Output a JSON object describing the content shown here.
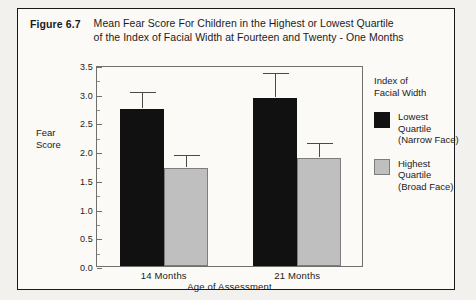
{
  "figure": {
    "label": "Figure 6.7",
    "caption_line1": "Mean Fear Score For Children in the Highest or Lowest Quartile",
    "caption_line2": "of the Index of Facial Width at Fourteen and Twenty - One Months"
  },
  "axis": {
    "y_title_line1": "Fear",
    "y_title_line2": "Score",
    "x_title": "Age of Assessment"
  },
  "legend": {
    "title_line1": "Index of",
    "title_line2": "Facial Width",
    "items": [
      {
        "swatch": "black",
        "line1": "Lowest",
        "line2": "Quartile",
        "line3": "(Narrow Face)"
      },
      {
        "swatch": "gray",
        "line1": "Highest",
        "line2": "Quartile",
        "line3": "(Broad Face)"
      }
    ]
  },
  "ticks": {
    "major": [
      "0.0",
      "0.5",
      "1.0",
      "1.5",
      "2.0",
      "2.5",
      "3.0",
      "3.5"
    ]
  },
  "chart_data": {
    "type": "bar",
    "title": "Mean Fear Score For Children in the Highest or Lowest Quartile of the Index of Facial Width at Fourteen and Twenty - One Months",
    "xlabel": "Age of Assessment",
    "ylabel": "Fear Score",
    "ylim": [
      0.0,
      3.5
    ],
    "ytick_step": 0.5,
    "yminor_step": 0.25,
    "grid": false,
    "legend_position": "right",
    "legend_title": "Index of Facial Width",
    "categories": [
      "14 Months",
      "21 Months"
    ],
    "series": [
      {
        "name": "Lowest Quartile (Narrow Face)",
        "color": "#111111",
        "values": [
          2.73,
          2.93
        ],
        "error_upper": [
          3.02,
          3.35
        ]
      },
      {
        "name": "Highest Quartile (Broad Face)",
        "color": "#bfbfbf",
        "values": [
          1.7,
          1.88
        ],
        "error_upper": [
          1.92,
          2.13
        ]
      }
    ]
  }
}
